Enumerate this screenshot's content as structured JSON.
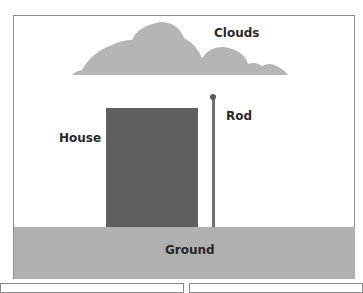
{
  "diagram": {
    "labels": {
      "clouds": "Clouds",
      "house": "House",
      "rod": "Rod",
      "ground": "Ground"
    },
    "colors": {
      "clouds": "#b5b5b5",
      "house": "#5f5f5f",
      "rod": "#707070",
      "ground": "#b0b0b0",
      "frame": "#8a8a8a"
    }
  }
}
